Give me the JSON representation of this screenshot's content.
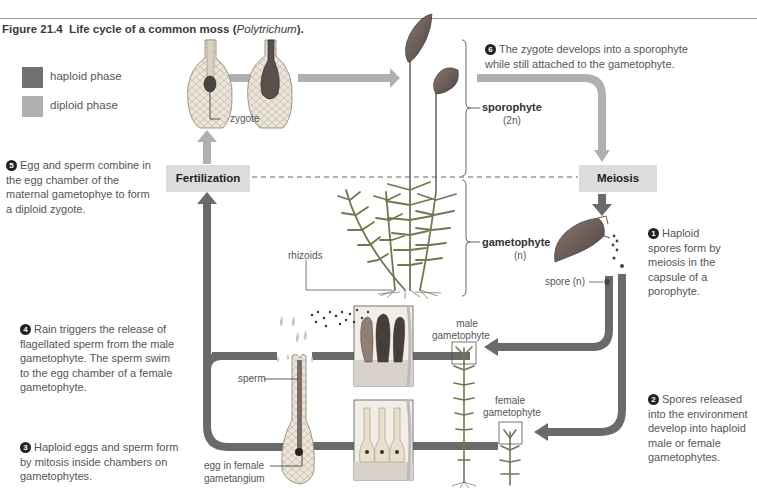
{
  "figure": {
    "number": "Figure 21.4",
    "title": "Life cycle of a common moss",
    "species": "Polytrichum",
    "title_suffix": "."
  },
  "legend": [
    {
      "label": "haploid phase",
      "color": "#707070"
    },
    {
      "label": "diploid phase",
      "color": "#b0b0b0"
    }
  ],
  "colors": {
    "haploid": "#707070",
    "diploid": "#b0b0b0",
    "phase_box": "#dcdcdc"
  },
  "phases": {
    "fertilization": "Fertilization",
    "meiosis": "Meiosis"
  },
  "steps": [
    {
      "num": "1",
      "text": "Haploid spores form by meiosis in the capsule of a porophyte."
    },
    {
      "num": "2",
      "text": "Spores released into the environment develop into haploid male or female gametophytes."
    },
    {
      "num": "3",
      "text": "Haploid eggs and sperm form by mitosis inside chambers on gametophytes."
    },
    {
      "num": "4",
      "text": "Rain triggers the release of flagellated sperm from the male gametophyte. The sperm swim to the egg chamber of a female gametophyte."
    },
    {
      "num": "5",
      "text": "Egg and sperm combine in the egg chamber of the maternal gametophye to form a diploid zygote."
    },
    {
      "num": "6",
      "text": "The zygote develops into a sporophyte while still attached to the gametophyte."
    }
  ],
  "labels": {
    "zygote": "zygote",
    "sporophyte": "sporophyte",
    "sporophyte_ploidy": "(2n)",
    "gametophyte": "gametophyte",
    "gametophyte_ploidy": "(n)",
    "rhizoids": "rhizoids",
    "spore": "spore (n)",
    "male_gametophyte_1": "male",
    "male_gametophyte_2": "gametophyte",
    "female_gametophyte_1": "female",
    "female_gametophyte_2": "gametophyte",
    "sperm": "sperm",
    "egg_1": "egg in female",
    "egg_2": "gametangium"
  }
}
